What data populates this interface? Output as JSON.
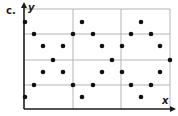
{
  "panel_label": "c.",
  "axes": {
    "x_label": "x",
    "y_label": "y"
  },
  "colors": {
    "grid": "#b5b5b5",
    "axis": "#1a1a1a",
    "dot": "#111111"
  },
  "grid": {
    "origin_px": [
      24,
      109
    ],
    "right_px": 170,
    "top_px": 9,
    "vertical_lines_px": [
      73,
      121,
      170
    ],
    "horizontal_lines_px": [
      9,
      34,
      60,
      85
    ]
  },
  "chart_data": {
    "type": "scatter",
    "title": "c.",
    "xlabel": "x",
    "ylabel": "y",
    "grid": true,
    "note": "Dot lattice on a 3x4 grid; pixel coordinates of each point",
    "points_px": [
      [
        25,
        22
      ],
      [
        82,
        22
      ],
      [
        141,
        22
      ],
      [
        34,
        34
      ],
      [
        73,
        34
      ],
      [
        93,
        34
      ],
      [
        131,
        34
      ],
      [
        151,
        34
      ],
      [
        43,
        46
      ],
      [
        63,
        46
      ],
      [
        102,
        46
      ],
      [
        122,
        46
      ],
      [
        160,
        46
      ],
      [
        53,
        60
      ],
      [
        112,
        60
      ],
      [
        170,
        60
      ],
      [
        43,
        72
      ],
      [
        63,
        72
      ],
      [
        102,
        72
      ],
      [
        122,
        72
      ],
      [
        160,
        72
      ],
      [
        34,
        85
      ],
      [
        73,
        85
      ],
      [
        93,
        85
      ],
      [
        131,
        85
      ],
      [
        151,
        85
      ],
      [
        25,
        97
      ],
      [
        82,
        97
      ],
      [
        141,
        97
      ]
    ]
  }
}
